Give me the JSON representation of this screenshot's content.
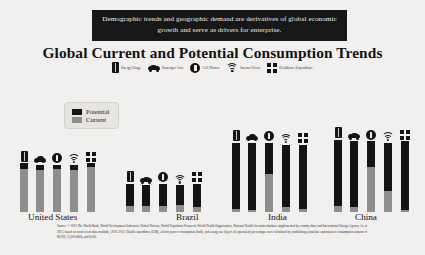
{
  "banner": {
    "text": "Demographic trends and geographic demand are derivatives of global economic growth and serve as drivers for enterprise."
  },
  "title": "Global Current and Potential Consumption Trends",
  "icon_legend": [
    {
      "icon": "energy-usage-icon",
      "label": "Energy Usage"
    },
    {
      "icon": "passenger-car-icon",
      "label": "Passenger Cars"
    },
    {
      "icon": "cell-phone-icon",
      "label": "Cell Phones"
    },
    {
      "icon": "internet-users-icon",
      "label": "Internet Users"
    },
    {
      "icon": "healthcare-expenditure-icon",
      "label": "Healthcare Expenditure"
    }
  ],
  "series_legend": [
    {
      "label": "Potential",
      "color": "#141414"
    },
    {
      "label": "Current",
      "color": "#8e8e8e"
    }
  ],
  "footnote": "Source: © 2013 The World Bank, World Development Indicators; United Nations, World Population Prospects; World Health Organization, National Health Accounts database supplemented by country data; and International Energy Agency. As of 2013, based on most recent data available, 2010–2012. Health expenditure (US$), electric power consumption (kwh), and energy use (kg of oil equivalent) percentages were calculated by establishing a baseline equivalent to consumption amount of $9,000, 11,000 kWh, and 8,000.",
  "chart_data": {
    "type": "bar",
    "title": "Global Current and Potential Consumption Trends",
    "xlabel": "",
    "ylabel": "",
    "ylim": [
      0,
      100
    ],
    "grid": false,
    "legend_position": "upper-left",
    "categories": [
      "United States",
      "Brazil",
      "India",
      "China"
    ],
    "metrics": [
      "Energy Usage",
      "Passenger Cars",
      "Cell Phones",
      "Internet Users",
      "Healthcare Expenditure"
    ],
    "stack_order": [
      "Current",
      "Potential"
    ],
    "series": [
      {
        "name": "Current",
        "color": "#8e8e8e",
        "values": [
          [
            88,
            90,
            92,
            90,
            93
          ],
          [
            22,
            24,
            20,
            26,
            18
          ],
          [
            4,
            3,
            55,
            7,
            4
          ],
          [
            8,
            7,
            64,
            30,
            3
          ]
        ]
      },
      {
        "name": "Potential",
        "color": "#141414",
        "values": [
          [
            12,
            10,
            8,
            10,
            7
          ],
          [
            78,
            76,
            80,
            74,
            82
          ],
          [
            96,
            97,
            45,
            93,
            96
          ],
          [
            92,
            93,
            36,
            70,
            97
          ]
        ]
      }
    ],
    "group_bar_totals": [
      [
        62,
        60,
        60,
        60,
        62
      ],
      [
        36,
        34,
        36,
        34,
        36
      ],
      [
        88,
        88,
        88,
        86,
        86
      ],
      [
        92,
        90,
        90,
        88,
        90
      ]
    ]
  }
}
